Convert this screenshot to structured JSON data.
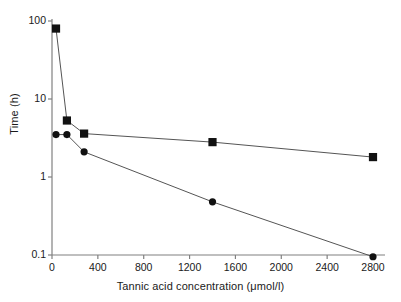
{
  "chart_data": {
    "type": "line",
    "title": "",
    "xlabel": "Tannic acid concentration (μmol/l)",
    "ylabel": "Time (h)",
    "xlim": [
      0,
      2800
    ],
    "ylim": [
      0.1,
      100
    ],
    "yscale": "log",
    "xscale": "linear",
    "grid": false,
    "legend": "none",
    "xticks": [
      "0",
      "400",
      "800",
      "1200",
      "1600",
      "2000",
      "2400",
      "2800"
    ],
    "xtick_values": [
      0,
      400,
      800,
      1200,
      1600,
      2000,
      2400,
      2800
    ],
    "yticks": [
      "100",
      "10",
      "1",
      "0.1"
    ],
    "ytick_values": [
      100,
      10,
      1,
      0.1
    ],
    "series": [
      {
        "name": "squares",
        "marker": "square",
        "color": "#111111",
        "x": [
          35,
          130,
          280,
          1400,
          2800
        ],
        "values": [
          80,
          5.3,
          3.6,
          2.8,
          1.8
        ]
      },
      {
        "name": "circles",
        "marker": "circle",
        "color": "#111111",
        "x": [
          35,
          130,
          280,
          1400,
          2800
        ],
        "values": [
          3.5,
          3.5,
          2.1,
          0.48,
          0.095
        ]
      }
    ]
  },
  "figure": {
    "axis_color": "#808080",
    "marker_color": "#111111",
    "line_color": "#555555",
    "background": "#ffffff"
  }
}
